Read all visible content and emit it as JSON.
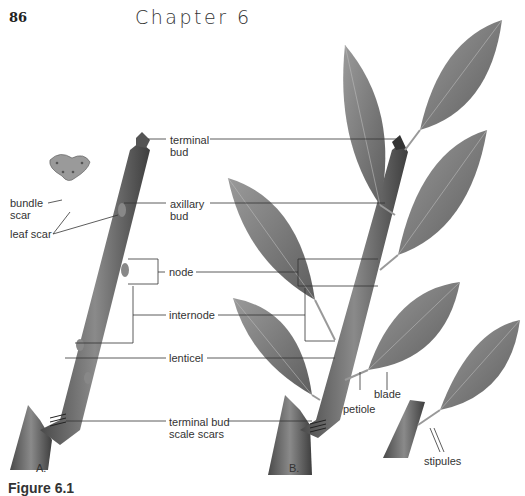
{
  "header": {
    "page_number": "86",
    "chapter_title": "Chapter 6"
  },
  "figure": {
    "caption_partial": "Figure 6.1",
    "panels": [
      "A.",
      "B."
    ],
    "labels": {
      "terminal_bud": "terminal\nbud",
      "axillary_bud": "axillary\nbud",
      "bundle_scar": "bundle\nscar",
      "leaf_scar": "leaf scar",
      "node": "node",
      "internode": "internode",
      "lenticel": "lenticel",
      "terminal_bud_scale_scars": "terminal bud\nscale scars",
      "petiole": "petiole",
      "blade": "blade",
      "stipules": "stipules"
    }
  },
  "colors": {
    "stem": "#6b6b6b",
    "leaf": "#8a8a8a",
    "leader_line": "#333333"
  }
}
